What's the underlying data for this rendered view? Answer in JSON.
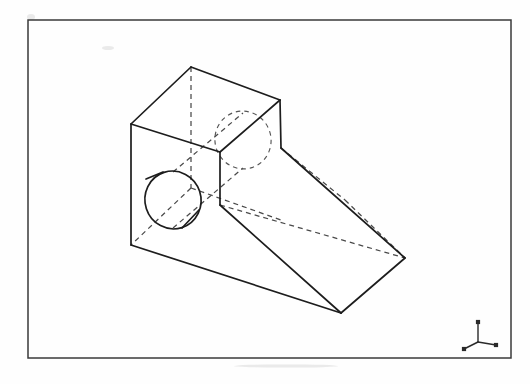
{
  "document": {
    "title": "Isometric Pictorial Drawing",
    "sheet_background": "#ffffff",
    "line_color": "#1d1d1d",
    "hidden_line_color": "#4a4a4a",
    "frame_color": "#3a3a3a"
  },
  "frame": {
    "name": "drawing-border",
    "x": 28,
    "y": 20,
    "width": 483,
    "height": 338
  },
  "projection": {
    "type": "isometric",
    "axis_indicator": {
      "name": "isometric-axis-triad",
      "origin": [
        478,
        342
      ],
      "legs": [
        {
          "label": "z-axis-up",
          "to": [
            478,
            322
          ]
        },
        {
          "label": "x-axis-left",
          "to": [
            464,
            349
          ]
        },
        {
          "label": "y-axis-right",
          "to": [
            496,
            345
          ]
        }
      ],
      "tip_size": 2.1
    }
  },
  "object": {
    "name": "wedge-block-with-through-hole",
    "description": "Isometric pictorial of a rectangular block with an inclined ramp extension and a cylindrical through hole",
    "vertices": {
      "top_left": [
        131,
        124
      ],
      "top_rear": [
        191,
        67
      ],
      "top_right": [
        280,
        100
      ],
      "top_front": [
        220,
        152
      ],
      "front_left_bottom": [
        131,
        245
      ],
      "front_center_bottom": [
        220,
        205
      ],
      "ramp_top_right": [
        281,
        148
      ],
      "ramp_far_right": [
        405,
        258
      ],
      "ramp_bottom_front": [
        341,
        313
      ],
      "ramp_rear_hidden": [
        345,
        200
      ]
    },
    "visible_faces": [
      {
        "name": "top-face",
        "points": "131,124 191,67 280,100 220,152"
      },
      {
        "name": "front-left-face",
        "points": "131,124 220,152 220,205 131,245"
      },
      {
        "name": "right-side-face",
        "points": "220,152 280,100 281,148 220,205"
      },
      {
        "name": "ramp-inclined-face",
        "points": "281,148 405,258 341,313 220,205"
      },
      {
        "name": "bottom-front-face",
        "points": "131,245 220,205 341,313"
      }
    ],
    "visible_edges": [
      {
        "name": "top-left-to-rear",
        "from": [
          131,
          124
        ],
        "to": [
          191,
          67
        ]
      },
      {
        "name": "top-rear-to-right",
        "from": [
          191,
          67
        ],
        "to": [
          280,
          100
        ]
      },
      {
        "name": "top-right-to-front",
        "from": [
          280,
          100
        ],
        "to": [
          220,
          152
        ]
      },
      {
        "name": "top-front-to-left",
        "from": [
          220,
          152
        ],
        "to": [
          131,
          124
        ]
      },
      {
        "name": "left-vertical-edge",
        "from": [
          131,
          124
        ],
        "to": [
          131,
          245
        ]
      },
      {
        "name": "center-vertical-edge",
        "from": [
          220,
          152
        ],
        "to": [
          220,
          205
        ]
      },
      {
        "name": "right-vertical-edge",
        "from": [
          280,
          100
        ],
        "to": [
          281,
          148
        ]
      },
      {
        "name": "ramp-upper-slope",
        "from": [
          281,
          148
        ],
        "to": [
          405,
          258
        ]
      },
      {
        "name": "ramp-right-end",
        "from": [
          405,
          258
        ],
        "to": [
          341,
          313
        ]
      },
      {
        "name": "ramp-lower-slope",
        "from": [
          341,
          313
        ],
        "to": [
          220,
          205
        ]
      },
      {
        "name": "bottom-front-edge",
        "from": [
          131,
          245
        ],
        "to": [
          341,
          313
        ]
      }
    ],
    "hidden_edges": [
      {
        "name": "rear-vertical-edge",
        "from": [
          191,
          67
        ],
        "to": [
          191,
          188
        ]
      },
      {
        "name": "rear-bottom-left-diagonal",
        "from": [
          191,
          188
        ],
        "to": [
          131,
          245
        ]
      },
      {
        "name": "rear-bottom-right-diagonal",
        "from": [
          191,
          188
        ],
        "to": [
          281,
          220
        ]
      },
      {
        "name": "rear-ramp-slope",
        "from": [
          345,
          200
        ],
        "to": [
          405,
          258
        ]
      },
      {
        "name": "rear-ramp-top-edge",
        "from": [
          281,
          148
        ],
        "to": [
          345,
          200
        ]
      },
      {
        "name": "rear-ramp-under-edge",
        "from": [
          220,
          205
        ],
        "to": [
          405,
          258
        ]
      },
      {
        "name": "hole-axis-upper",
        "from": [
          173,
          172
        ],
        "to": [
          243,
          113
        ]
      },
      {
        "name": "hole-axis-lower",
        "from": [
          173,
          228
        ],
        "to": [
          243,
          168
        ]
      }
    ],
    "hole": {
      "name": "cylindrical-through-hole",
      "near_circle": {
        "name": "hole-front-circle-visible",
        "cx": 173,
        "cy": 200,
        "rx": 28,
        "ry": 29,
        "rotation": -18
      },
      "far_circle": {
        "name": "hole-rear-circle-hidden",
        "cx": 243,
        "cy": 140,
        "rx": 28,
        "ry": 29,
        "rotation": -18
      },
      "tangent_chords": [
        {
          "name": "hole-chord-lower",
          "from": [
            182,
            228
          ],
          "to": [
            199,
            210
          ]
        },
        {
          "name": "hole-chord-upper",
          "from": [
            146,
            179
          ],
          "to": [
            163,
            172
          ]
        }
      ]
    }
  }
}
